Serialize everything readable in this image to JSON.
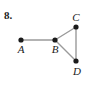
{
  "figure": {
    "exercise_number": "8.",
    "caption": "",
    "background_color": "#ffffff",
    "edge_color": "#9a9a9a",
    "vertex_color": "#1a1a1a",
    "label_color": "#1a1a1a",
    "width": 92,
    "height": 91
  },
  "chart_data": {
    "type": "diagram",
    "title": "8.",
    "graph": {
      "directed": false,
      "nodes": [
        {
          "id": "A",
          "label": "A",
          "x": 21,
          "y": 40,
          "label_x": 21,
          "label_y": 53,
          "label_anchor": "middle"
        },
        {
          "id": "B",
          "label": "B",
          "x": 55,
          "y": 40,
          "label_x": 55,
          "label_y": 53,
          "label_anchor": "middle"
        },
        {
          "id": "C",
          "label": "C",
          "x": 76,
          "y": 27,
          "label_x": 76,
          "label_y": 21,
          "label_anchor": "middle"
        },
        {
          "id": "D",
          "label": "D",
          "x": 76,
          "y": 61,
          "label_x": 77,
          "label_y": 75,
          "label_anchor": "middle"
        }
      ],
      "edges": [
        {
          "from": "A",
          "to": "B"
        },
        {
          "from": "B",
          "to": "C"
        },
        {
          "from": "B",
          "to": "D"
        },
        {
          "from": "C",
          "to": "D"
        }
      ],
      "node_radius": 2.6,
      "edge_width": 1.4
    }
  }
}
